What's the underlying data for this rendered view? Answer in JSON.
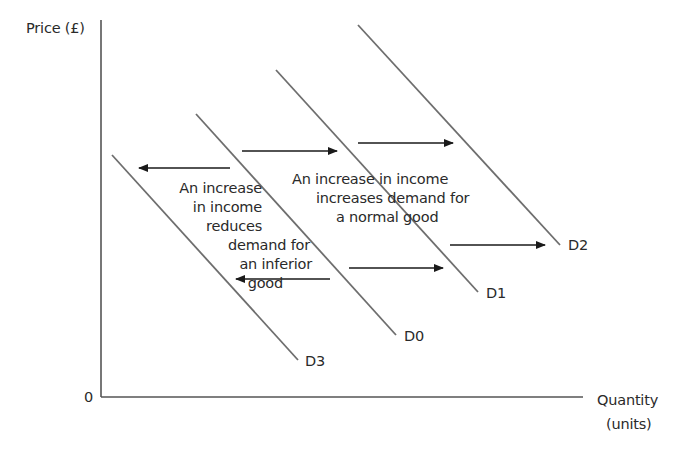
{
  "axes": {
    "y_label": "Price (£)",
    "x_label_line1": "Quantity",
    "x_label_line2": "(units)",
    "origin_label": "0"
  },
  "curves": [
    {
      "id": "D3",
      "label": "D3",
      "x1": 112,
      "y1": 155,
      "x2": 298,
      "y2": 360,
      "label_x": 305,
      "label_y": 354
    },
    {
      "id": "D0",
      "label": "D0",
      "x1": 196,
      "y1": 114,
      "x2": 396,
      "y2": 335,
      "label_x": 404,
      "label_y": 329
    },
    {
      "id": "D1",
      "label": "D1",
      "x1": 276,
      "y1": 70,
      "x2": 478,
      "y2": 292,
      "label_x": 486,
      "label_y": 286
    },
    {
      "id": "D2",
      "label": "D2",
      "x1": 358,
      "y1": 25,
      "x2": 560,
      "y2": 245,
      "label_x": 568,
      "label_y": 238
    }
  ],
  "arrows": [
    {
      "from_x": 230,
      "to_x": 139,
      "y": 168,
      "direction": "left"
    },
    {
      "from_x": 330,
      "to_x": 236,
      "y": 279,
      "direction": "left"
    },
    {
      "from_x": 242,
      "to_x": 337,
      "y": 151,
      "direction": "right"
    },
    {
      "from_x": 358,
      "to_x": 453,
      "y": 143,
      "direction": "right"
    },
    {
      "from_x": 349,
      "to_x": 443,
      "y": 268,
      "direction": "right"
    },
    {
      "from_x": 450,
      "to_x": 545,
      "y": 245,
      "direction": "right"
    }
  ],
  "annotations": {
    "inferior": {
      "lines": [
        "An increase",
        "in income",
        "reduces",
        "demand for",
        "an inferior",
        "good"
      ]
    },
    "normal": {
      "lines": [
        "An increase in income",
        "increases demand for",
        "a normal good"
      ]
    }
  },
  "colors": {
    "axis": "#555555",
    "curve": "#6e6e6e",
    "arrow": "#1a1a1a",
    "text": "#2a2a2a"
  }
}
